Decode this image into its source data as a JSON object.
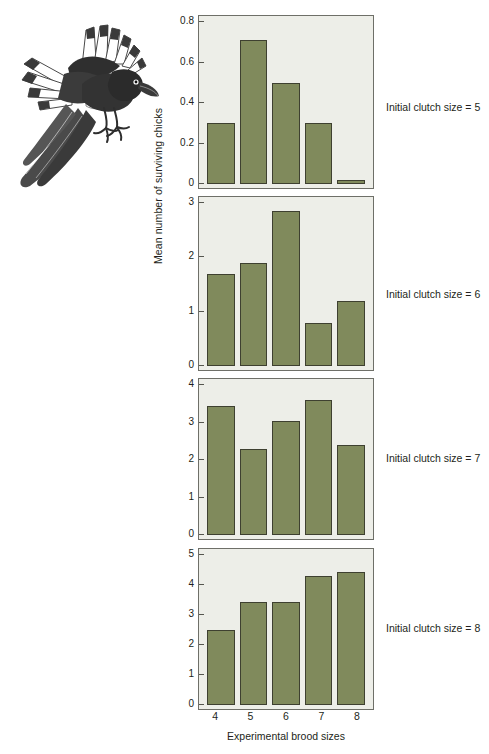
{
  "figure": {
    "name": "magpie-brood-manipulation-figure",
    "illustration_caption": "magpie-in-flight-illustration",
    "bar_color": "#808a5c",
    "bar_border_color": "#3e4030",
    "panel_background": "#edeee8",
    "panel_border_color": "#6e6f68"
  },
  "chart_data": {
    "type": "bar",
    "title": "",
    "xlabel": "Experimental brood sizes",
    "ylabel": "Mean number of surviving chicks",
    "categories": [
      "4",
      "5",
      "6",
      "7",
      "8"
    ],
    "grid": false,
    "legend_position": "right",
    "panels": [
      {
        "label": "Initial clutch size = 5",
        "values": [
          0.3,
          0.71,
          0.5,
          0.3,
          0.02
        ],
        "ylim": [
          0,
          0.8
        ],
        "yticks": [
          "0",
          "0.2",
          "0.4",
          "0.6",
          "0.8"
        ],
        "ytick_values": [
          0,
          0.2,
          0.4,
          0.6,
          0.8
        ]
      },
      {
        "label": "Initial clutch size = 6",
        "values": [
          1.7,
          1.9,
          2.85,
          0.8,
          1.2
        ],
        "ylim": [
          0,
          3
        ],
        "yticks": [
          "0",
          "1",
          "2",
          "3"
        ],
        "ytick_values": [
          0,
          1,
          2,
          3
        ]
      },
      {
        "label": "Initial clutch size = 7",
        "values": [
          3.45,
          2.3,
          3.05,
          3.6,
          2.4
        ],
        "ylim": [
          0,
          4
        ],
        "yticks": [
          "0",
          "1",
          "2",
          "3",
          "4"
        ],
        "ytick_values": [
          0,
          1,
          2,
          3,
          4
        ]
      },
      {
        "label": "Initial clutch size = 8",
        "values": [
          2.5,
          3.45,
          3.45,
          4.3,
          4.45
        ],
        "ylim": [
          0,
          5
        ],
        "yticks": [
          "0",
          "1",
          "2",
          "3",
          "4",
          "5"
        ],
        "ytick_values": [
          0,
          1,
          2,
          3,
          4,
          5
        ]
      }
    ]
  }
}
